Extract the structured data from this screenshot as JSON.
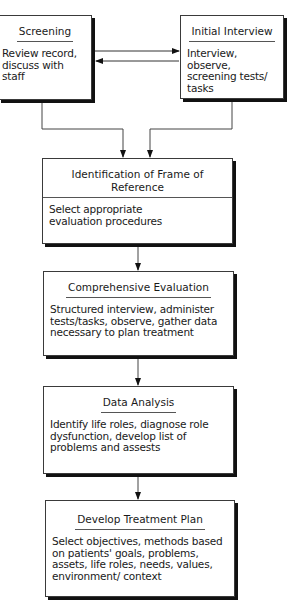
{
  "diagram": {
    "type": "flowchart",
    "nodes": [
      {
        "id": "screening",
        "title": "Screening",
        "text": "Review record, discuss with staff"
      },
      {
        "id": "initial_interview",
        "title": "Initial Interview",
        "text": "Interview, observe, screening tests/ tasks"
      },
      {
        "id": "frame_of_reference",
        "title": "Identification of Frame of Reference",
        "text": "Select appropriate evaluation procedures"
      },
      {
        "id": "comprehensive_evaluation",
        "title": "Comprehensive Evaluation",
        "text": "Structured interview, administer tests/tasks, observe, gather data necessary to plan treatment"
      },
      {
        "id": "data_analysis",
        "title": "Data Analysis",
        "text": "Identify life roles, diagnose role dysfunction, develop list of problems and assests"
      },
      {
        "id": "treatment_plan",
        "title": "Develop Treatment Plan",
        "text": "Select objectives, methods based on patients' goals, problems, assets, life roles, needs, values, environment/ context"
      }
    ],
    "edges": [
      {
        "from": "screening",
        "to": "initial_interview"
      },
      {
        "from": "initial_interview",
        "to": "screening"
      },
      {
        "from": "screening",
        "to": "frame_of_reference"
      },
      {
        "from": "initial_interview",
        "to": "frame_of_reference"
      },
      {
        "from": "frame_of_reference",
        "to": "comprehensive_evaluation"
      },
      {
        "from": "comprehensive_evaluation",
        "to": "data_analysis"
      },
      {
        "from": "data_analysis",
        "to": "treatment_plan"
      }
    ]
  }
}
